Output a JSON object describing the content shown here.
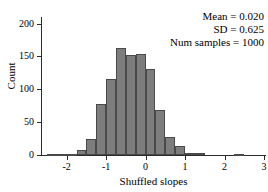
{
  "chart_data": {
    "type": "bar",
    "title": "",
    "xlabel": "Shuffled slopes",
    "ylabel": "Count",
    "xlim": [
      -2.65,
      3.05
    ],
    "ylim": [
      0,
      210
    ],
    "grid": false,
    "legend_position": "none",
    "bin_width": 0.25,
    "bin_left_edges": [
      -2.5,
      -2.25,
      -2.0,
      -1.75,
      -1.5,
      -1.25,
      -1.0,
      -0.75,
      -0.5,
      -0.25,
      0.0,
      0.25,
      0.5,
      0.75,
      1.0,
      1.25,
      1.5,
      1.75,
      2.0,
      2.25
    ],
    "bin_centers": [
      -2.375,
      -2.125,
      -1.875,
      -1.625,
      -1.375,
      -1.125,
      -0.875,
      -0.625,
      -0.375,
      -0.125,
      0.125,
      0.375,
      0.625,
      0.875,
      1.125,
      1.375,
      1.625,
      1.875,
      2.125,
      2.375
    ],
    "categories": [
      "-2.50 to -2.25",
      "-2.25 to -2.00",
      "-2.00 to -1.75",
      "-1.75 to -1.50",
      "-1.50 to -1.25",
      "-1.25 to -1.00",
      "-1.00 to -0.75",
      "-0.75 to -0.50",
      "-0.50 to -0.25",
      "-0.25 to 0.00",
      "0.00 to 0.25",
      "0.25 to 0.50",
      "0.50 to 0.75",
      "0.75 to 1.00",
      "1.00 to 1.25",
      "1.25 to 1.50",
      "1.50 to 1.75",
      "1.75 to 2.00",
      "2.00 to 2.25",
      "2.25 to 2.50"
    ],
    "values": [
      2,
      2,
      2,
      8,
      25,
      77,
      116,
      163,
      152,
      154,
      131,
      68,
      27,
      13,
      3,
      3,
      0,
      0,
      0,
      2
    ],
    "xticks": [
      -2,
      -1,
      0,
      1,
      2,
      3
    ],
    "xtick_labels": [
      "-2",
      "-1",
      "0",
      "1",
      "2",
      "3"
    ],
    "yticks": [
      0,
      50,
      100,
      150,
      200
    ],
    "ytick_labels": [
      "0",
      "50",
      "100",
      "150",
      "200"
    ],
    "bar_color": "#7d7d7d",
    "bar_edge_color": "#4a4a4a",
    "annotations": [
      "Mean = 0.020",
      "SD = 0.625",
      "Num samples = 1000"
    ]
  },
  "stats": {
    "mean_label": "Mean = 0.020",
    "sd_label": "SD = 0.625",
    "num_samples_label": "Num samples = 1000"
  }
}
